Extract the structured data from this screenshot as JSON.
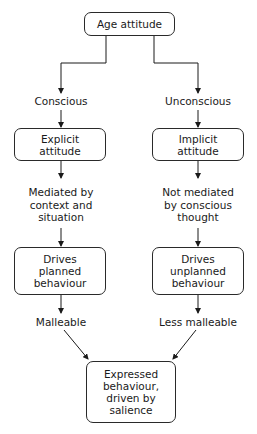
{
  "diagram": {
    "type": "flowchart",
    "root": {
      "id": "age-attitude",
      "label": "Age attitude"
    },
    "branches": {
      "left": {
        "mode_label": "Conscious",
        "attitude_box": "Explicit attitude",
        "attitude_box_lines": [
          "Explicit",
          "attitude"
        ],
        "mediation_lines": [
          "Mediated by",
          "context and",
          "situation"
        ],
        "behaviour_box_lines": [
          "Drives",
          "planned",
          "behaviour"
        ],
        "malleability_label": "Malleable"
      },
      "right": {
        "mode_label": "Unconscious",
        "attitude_box": "Implicit attitude",
        "attitude_box_lines": [
          "Implicit",
          "attitude"
        ],
        "mediation_lines": [
          "Not mediated",
          "by conscious",
          "thought"
        ],
        "behaviour_box_lines": [
          "Drives",
          "unplanned",
          "behaviour"
        ],
        "malleability_label": "Less malleable"
      }
    },
    "outcome": {
      "id": "expressed-behaviour",
      "lines": [
        "Expressed",
        "behaviour,",
        "driven by",
        "salience"
      ]
    },
    "edges": [
      {
        "from": "Age attitude",
        "to": "Conscious"
      },
      {
        "from": "Age attitude",
        "to": "Unconscious"
      },
      {
        "from": "Conscious",
        "to": "Explicit attitude"
      },
      {
        "from": "Unconscious",
        "to": "Implicit attitude"
      },
      {
        "from": "Explicit attitude",
        "to": "Mediated by context and situation"
      },
      {
        "from": "Implicit attitude",
        "to": "Not mediated by conscious thought"
      },
      {
        "from": "Mediated by context and situation",
        "to": "Drives planned behaviour"
      },
      {
        "from": "Not mediated by conscious thought",
        "to": "Drives unplanned behaviour"
      },
      {
        "from": "Drives planned behaviour",
        "to": "Malleable"
      },
      {
        "from": "Drives unplanned behaviour",
        "to": "Less malleable"
      },
      {
        "from": "Malleable",
        "to": "Expressed behaviour, driven by salience"
      },
      {
        "from": "Less malleable",
        "to": "Expressed behaviour, driven by salience"
      }
    ],
    "colors": {
      "line": "#1a1a1a",
      "box_border": "#2a2a2a",
      "background": "#ffffff",
      "text": "#1a1a1a"
    }
  }
}
